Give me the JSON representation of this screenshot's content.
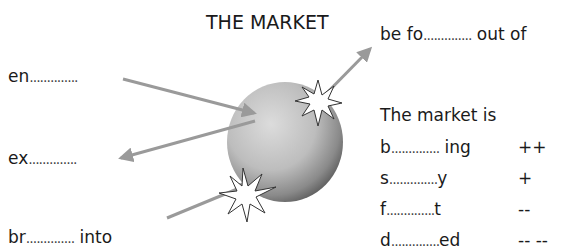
{
  "title": "THE MARKET",
  "left_words": {
    "enter": {
      "prefix": "en",
      "blank": "..............",
      "suffix": ""
    },
    "exit": {
      "prefix": "ex",
      "blank": "..............",
      "suffix": ""
    },
    "break_into": {
      "prefix": "br",
      "blank": "..............",
      "suffix": " into"
    }
  },
  "right_words": {
    "forced_out": {
      "prefix": "be fo",
      "blank": "..............",
      "suffix": " out of"
    },
    "heading": "The market is",
    "states": [
      {
        "prefix": "b",
        "blank": "..............",
        "suffix": " ing",
        "symbol": "++"
      },
      {
        "prefix": "s",
        "blank": "..............",
        "suffix": "y",
        "symbol": "+"
      },
      {
        "prefix": "f",
        "blank": "..............",
        "suffix": "t",
        "symbol": "--"
      },
      {
        "prefix": "d",
        "blank": "..............",
        "suffix": "ed",
        "symbol": "-- --"
      }
    ]
  },
  "colors": {
    "arrow": "#9a9a9a",
    "sphere_light": "#d6d6d6",
    "sphere_dark": "#6e6e6e",
    "text": "#1a1a1a"
  }
}
